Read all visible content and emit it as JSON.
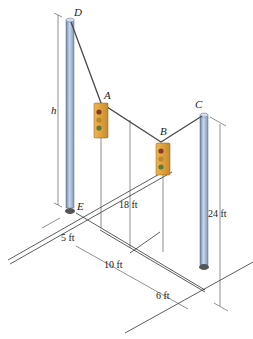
{
  "diagram": {
    "points": {
      "D": "D",
      "A": "A",
      "B": "B",
      "C": "C",
      "E": "E"
    },
    "variables": {
      "h": "h"
    },
    "dimensions": {
      "dim_18": "18 ft",
      "dim_24": "24 ft",
      "dim_5": "5 ft",
      "dim_10": "10 ft",
      "dim_6": "6 ft"
    },
    "components": {
      "pole_left": "pole DE",
      "pole_right": "pole C",
      "traffic_light_A": "traffic light at A",
      "traffic_light_B": "traffic light at B",
      "cable": "cable D-A-B-C"
    },
    "colors": {
      "pole": "#a8bdd8",
      "pole_shadow": "#6f86a8",
      "traffic_light": "#e0a040",
      "cable": "#4a4a4a"
    }
  }
}
